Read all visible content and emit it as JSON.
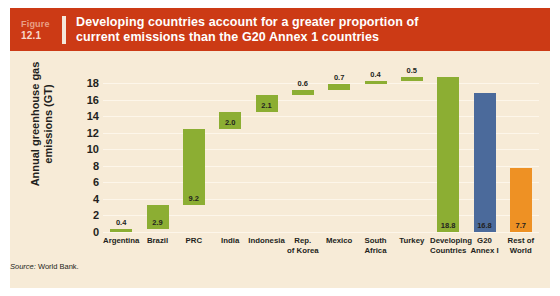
{
  "header": {
    "figure_word": "Figure",
    "figure_number": "12.1",
    "title_line1": "Developing countries account for a greater proportion of",
    "title_line2": "current emissions than the G20 Annex 1 countries",
    "banner_color": "#CC3A15",
    "title_color": "#FFFFFF"
  },
  "panel": {
    "background_color": "#F7EBD7"
  },
  "source": {
    "keyword": "Source:",
    "text": " World Bank."
  },
  "chart_data": {
    "type": "bar",
    "subtype": "waterfall",
    "title": "Developing countries account for a greater proportion of current emissions than the G20 Annex 1 countries",
    "xlabel": "",
    "ylabel": "Annual greenhouse gas emissions (GT)",
    "ylim": [
      0,
      19
    ],
    "yticks": [
      0,
      2,
      4,
      6,
      8,
      10,
      12,
      14,
      16,
      18
    ],
    "grid": true,
    "legend": "none",
    "categories": [
      "Argentina",
      "Brazil",
      "PRC",
      "India",
      "Indonesia",
      "Rep. of Korea",
      "Mexico",
      "South Africa",
      "Turkey",
      "Developing Countries",
      "G20 Annex I",
      "Rest of World"
    ],
    "category_label_lines": [
      [
        "Argentina"
      ],
      [
        "Brazil"
      ],
      [
        "PRC"
      ],
      [
        "India"
      ],
      [
        "Indonesia"
      ],
      [
        "Rep.",
        "of Korea"
      ],
      [
        "Mexico"
      ],
      [
        "South",
        "Africa"
      ],
      [
        "Turkey"
      ],
      [
        "Developing",
        "Countries"
      ],
      [
        "G20",
        "Annex I"
      ],
      [
        "Rest of",
        "World"
      ]
    ],
    "values": [
      0.4,
      2.9,
      9.2,
      2.0,
      2.1,
      0.6,
      0.7,
      0.4,
      0.5,
      18.8,
      16.8,
      7.7
    ],
    "bar_bases": [
      0,
      0.4,
      3.3,
      12.5,
      14.5,
      16.6,
      17.2,
      17.9,
      18.3,
      0,
      0,
      0
    ],
    "bar_tops": [
      0.4,
      3.3,
      12.5,
      14.5,
      16.6,
      17.2,
      17.9,
      18.3,
      18.8,
      18.8,
      16.8,
      7.7
    ],
    "bar_colors": [
      "#8CAE33",
      "#8CAE33",
      "#8CAE33",
      "#8CAE33",
      "#8CAE33",
      "#8CAE33",
      "#8CAE33",
      "#8CAE33",
      "#8CAE33",
      "#8CAE33",
      "#4B6A9B",
      "#EE9124"
    ],
    "value_labels": [
      "0.4",
      "2.9",
      "9.2",
      "2.0",
      "2.1",
      "0.6",
      "0.7",
      "0.4",
      "0.5",
      "18.8",
      "16.8",
      "7.7"
    ],
    "value_label_placement": [
      "above",
      "inside-bottom",
      "inside-bottom",
      "inside-bottom",
      "inside-bottom",
      "above",
      "above",
      "above",
      "above",
      "inside-bottom",
      "inside-bottom",
      "inside-bottom"
    ],
    "series": [
      {
        "name": "Annual greenhouse gas emissions (GT)",
        "values": [
          0.4,
          2.9,
          9.2,
          2.0,
          2.1,
          0.6,
          0.7,
          0.4,
          0.5,
          18.8,
          16.8,
          7.7
        ]
      }
    ]
  }
}
